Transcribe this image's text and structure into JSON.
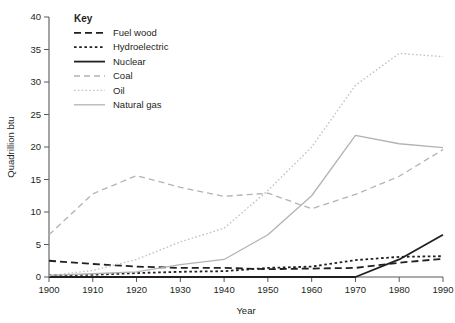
{
  "chart_data": {
    "type": "line",
    "title": "",
    "xlabel": "Year",
    "ylabel": "Quadrillion btu",
    "x": [
      1900,
      1910,
      1920,
      1930,
      1940,
      1950,
      1960,
      1970,
      1980,
      1990
    ],
    "xlim": [
      1900,
      1990
    ],
    "ylim": [
      0,
      40
    ],
    "ytick_step": 5,
    "grid": false,
    "legend_title": "Key",
    "legend_position": "top-left-inside",
    "xticks": [
      "1900",
      "1910",
      "1920",
      "1930",
      "1940",
      "1950",
      "1960",
      "1970",
      "1980",
      "1990"
    ],
    "yticks": [
      "0",
      "5",
      "10",
      "15",
      "20",
      "25",
      "30",
      "35",
      "40"
    ],
    "series": [
      {
        "name": "Fuel wood",
        "style": "dashed",
        "color": "#231f20",
        "width": 1.8,
        "dash": "7,4",
        "values": [
          2.5,
          2.0,
          1.6,
          1.4,
          1.4,
          1.2,
          1.3,
          1.4,
          2.2,
          2.8
        ]
      },
      {
        "name": "Hydroelectric",
        "style": "dotted",
        "color": "#231f20",
        "width": 1.8,
        "dash": "2.6,2.6",
        "values": [
          0.25,
          0.35,
          0.6,
          0.8,
          0.9,
          1.4,
          1.6,
          2.6,
          3.1,
          3.2
        ]
      },
      {
        "name": "Nuclear",
        "style": "solid",
        "color": "#231f20",
        "width": 1.8,
        "dash": "none",
        "values": [
          0,
          0,
          0,
          0,
          0,
          0,
          0,
          0.0,
          2.7,
          6.5
        ]
      },
      {
        "name": "Coal",
        "style": "dashed",
        "color": "#b3b3b3",
        "width": 1.3,
        "dash": "6,4",
        "values": [
          6.5,
          12.8,
          15.6,
          13.8,
          12.4,
          12.9,
          10.5,
          12.7,
          15.5,
          19.6
        ]
      },
      {
        "name": "Oil",
        "style": "dotted",
        "color": "#c4c4c4",
        "width": 1.4,
        "dash": "1.6,2.2",
        "values": [
          0.2,
          1.0,
          2.7,
          5.4,
          7.5,
          13.3,
          20.0,
          29.5,
          34.4,
          33.9
        ]
      },
      {
        "name": "Natural gas",
        "style": "solid",
        "color": "#b3b3b3",
        "width": 1.3,
        "dash": "none",
        "values": [
          0.25,
          0.5,
          0.8,
          1.9,
          2.7,
          6.5,
          12.5,
          21.8,
          20.5,
          19.9
        ]
      }
    ]
  },
  "axes": {
    "ylabel": "Quadrillion btu",
    "xlabel": "Year"
  },
  "legend": {
    "title": "Key",
    "items": [
      {
        "label": "Fuel wood"
      },
      {
        "label": "Hydroelectric"
      },
      {
        "label": "Nuclear"
      },
      {
        "label": "Coal"
      },
      {
        "label": "Oil"
      },
      {
        "label": "Natural gas"
      }
    ]
  }
}
